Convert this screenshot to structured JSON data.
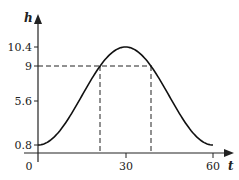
{
  "chart_data": {
    "type": "line",
    "title": "",
    "xlabel": "t",
    "ylabel": "h",
    "x_ticks": [
      0,
      30,
      60
    ],
    "x_tick_labels": [
      "0",
      "30",
      "60"
    ],
    "y_ticks": [
      0.8,
      5.6,
      9,
      10.4
    ],
    "y_tick_labels": [
      "0.8",
      "5.6",
      "9",
      "10.4"
    ],
    "xlim": [
      0,
      60
    ],
    "ylim": [
      0,
      10.4
    ],
    "grid": false,
    "series": [
      {
        "name": "h(t)",
        "formula": "h = 5.6 - 4.8 cos(pi t / 30)",
        "x": [
          0,
          5,
          10,
          15,
          20,
          25,
          30,
          35,
          40,
          45,
          50,
          55,
          60
        ],
        "values": [
          0.8,
          1.44,
          3.2,
          5.6,
          8.0,
          9.76,
          10.4,
          9.76,
          8.0,
          5.6,
          3.2,
          1.44,
          0.8
        ]
      }
    ],
    "annotations": [
      {
        "type": "hline-dashed",
        "y": 9,
        "from_x": 0,
        "to_x": 40
      },
      {
        "type": "vline-dashed",
        "x": 20,
        "from_y": 0,
        "to_y": 9
      },
      {
        "type": "vline-dashed",
        "x": 40,
        "from_y": 0,
        "to_y": 9
      }
    ]
  },
  "labels": {
    "x_axis": "t",
    "y_axis": "h",
    "origin": "0",
    "x30": "30",
    "x60": "60",
    "y08": "0.8",
    "y56": "5.6",
    "y9": "9",
    "y104": "10.4"
  }
}
